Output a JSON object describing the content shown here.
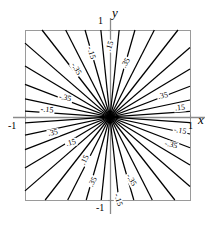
{
  "figure": {
    "kind": "contour-plot",
    "background_color": "#ffffff",
    "frame_color": "#9a9a9a",
    "axis_color": "#8a8a8a",
    "contour_color": "#000000"
  },
  "axes": {
    "x_name": "x",
    "y_name": "y",
    "x_ticks": [
      {
        "label": "-1",
        "value": -1
      },
      {
        "label": "1",
        "value": 1
      }
    ],
    "y_ticks": [
      {
        "label": "1",
        "value": 1
      },
      {
        "label": "-1",
        "value": -1
      }
    ]
  },
  "chart_data": {
    "type": "line",
    "title": "",
    "subtitle": "",
    "xlabel": "x",
    "ylabel": "y",
    "xlim": [
      -1,
      1
    ],
    "ylim": [
      -1,
      1
    ],
    "grid": false,
    "legend": "none",
    "levels": [
      -0.35,
      -0.15,
      0.15,
      0.35
    ],
    "level_labels": [
      "-.35",
      "-.15",
      ".15",
      ".35"
    ],
    "contours": [
      {
        "id": "c1",
        "level": 0.15,
        "label": ".15",
        "angle_deg": 4
      },
      {
        "id": "c2",
        "level": 0.35,
        "label": ".35",
        "angle_deg": 12
      },
      {
        "id": "c3",
        "level": 0.35,
        "label": ".35",
        "angle_deg": 21
      },
      {
        "id": "c4",
        "level": 0.15,
        "label": ".15",
        "angle_deg": 31
      },
      {
        "id": "c5",
        "level": 0.15,
        "label": ".15",
        "angle_deg": 41
      },
      {
        "id": "c6",
        "level": 0.35,
        "label": ".35",
        "angle_deg": 52
      },
      {
        "id": "c7",
        "level": 0.35,
        "label": ".35",
        "angle_deg": 63
      },
      {
        "id": "c8",
        "level": 0.15,
        "label": ".15",
        "angle_deg": 74
      },
      {
        "id": "c9",
        "level": 0.15,
        "label": ".15",
        "angle_deg": 84
      },
      {
        "id": "c10",
        "level": -0.15,
        "label": "-.15",
        "angle_deg": 96
      },
      {
        "id": "c11",
        "level": -0.15,
        "label": "-.15",
        "angle_deg": 106
      },
      {
        "id": "c12",
        "level": -0.35,
        "label": "-.35",
        "angle_deg": 117
      },
      {
        "id": "c13",
        "level": -0.35,
        "label": "-.35",
        "angle_deg": 128
      },
      {
        "id": "c14",
        "level": -0.15,
        "label": "-.15",
        "angle_deg": 139
      },
      {
        "id": "c15",
        "level": -0.15,
        "label": "-.15",
        "angle_deg": 149
      },
      {
        "id": "c16",
        "level": -0.35,
        "label": "-.35",
        "angle_deg": 159
      },
      {
        "id": "c17",
        "level": -0.35,
        "label": "-.35",
        "angle_deg": 168
      },
      {
        "id": "c18",
        "level": -0.15,
        "label": "-.15",
        "angle_deg": 176
      }
    ],
    "annotations": [
      {
        "text": ".15",
        "x_px": 110,
        "y_px": 46,
        "rot_deg": -72
      },
      {
        "text": ".35",
        "x_px": 126,
        "y_px": 63,
        "rot_deg": -60
      },
      {
        "text": "-.15",
        "x_px": 91,
        "y_px": 53,
        "rot_deg": 72
      },
      {
        "text": "-.35",
        "x_px": 76,
        "y_px": 69,
        "rot_deg": 60
      },
      {
        "text": ".35",
        "x_px": 163,
        "y_px": 96,
        "rot_deg": -12
      },
      {
        "text": ".15",
        "x_px": 180,
        "y_px": 108,
        "rot_deg": -6
      },
      {
        "text": "-.15",
        "x_px": 180,
        "y_px": 131,
        "rot_deg": 10
      },
      {
        "text": "-.35",
        "x_px": 171,
        "y_px": 145,
        "rot_deg": 14
      },
      {
        "text": "-.35",
        "x_px": 65,
        "y_px": 98,
        "rot_deg": 12
      },
      {
        "text": "-.15",
        "x_px": 47,
        "y_px": 110,
        "rot_deg": 5
      },
      {
        "text": ".35",
        "x_px": 53,
        "y_px": 133,
        "rot_deg": -10
      },
      {
        "text": ".15",
        "x_px": 71,
        "y_px": 143,
        "rot_deg": -16
      },
      {
        "text": ".15",
        "x_px": 85,
        "y_px": 160,
        "rot_deg": -64
      },
      {
        "text": ".35",
        "x_px": 93,
        "y_px": 182,
        "rot_deg": -62
      },
      {
        "text": "-.35",
        "x_px": 131,
        "y_px": 180,
        "rot_deg": 60
      },
      {
        "text": "-.15",
        "x_px": 118,
        "y_px": 200,
        "rot_deg": 72
      }
    ]
  },
  "geometry": {
    "frame": {
      "left": 25,
      "top": 30,
      "right": 190,
      "bottom": 200
    },
    "origin": {
      "x": 110,
      "y": 117
    },
    "x_axis_y": 117,
    "y_axis_x": 110,
    "y_axis_top": 18,
    "y_axis_bottom": 214,
    "x_axis_left": 13,
    "x_axis_right": 205
  },
  "labels": {
    "y_axis_name_pos": {
      "x": 112,
      "y": 6
    },
    "x_axis_name_pos": {
      "x": 198,
      "y": 113
    },
    "y_top_tick_pos": {
      "x": 98,
      "y": 16
    },
    "y_bottom_tick_pos": {
      "x": 96,
      "y": 203
    },
    "x_left_tick_pos": {
      "x": 8,
      "y": 121
    },
    "x_right_tick_pos": {
      "x": 188,
      "y": 121
    }
  }
}
